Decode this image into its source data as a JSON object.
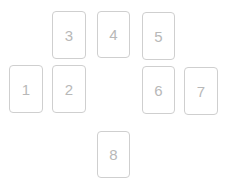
{
  "layout": {
    "title": "",
    "positions": [
      {
        "label": "1",
        "x": 9,
        "y": 65,
        "w": 34,
        "h": 48
      },
      {
        "label": "2",
        "x": 52,
        "y": 65,
        "w": 34,
        "h": 48
      },
      {
        "label": "3",
        "x": 52,
        "y": 11,
        "w": 34,
        "h": 48
      },
      {
        "label": "4",
        "x": 97,
        "y": 11,
        "w": 33,
        "h": 47
      },
      {
        "label": "5",
        "x": 142,
        "y": 12,
        "w": 33,
        "h": 48
      },
      {
        "label": "6",
        "x": 142,
        "y": 66,
        "w": 33,
        "h": 48
      },
      {
        "label": "7",
        "x": 184,
        "y": 67,
        "w": 34,
        "h": 48
      },
      {
        "label": "8",
        "x": 97,
        "y": 131,
        "w": 33,
        "h": 47
      }
    ]
  },
  "colors": {
    "border": "#cfcfcf",
    "text": "#b8b8b8",
    "background": "#ffffff"
  }
}
